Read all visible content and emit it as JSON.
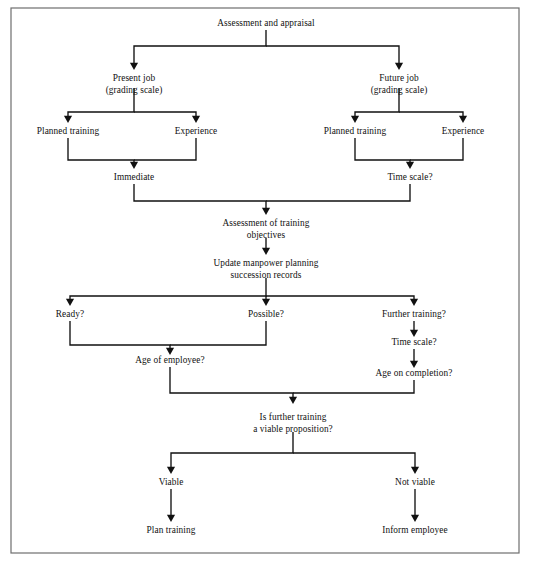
{
  "figure": {
    "title": "Assessment and appraisal",
    "frame": {
      "x": 11,
      "y": 8,
      "width": 508,
      "height": 545,
      "border_color": "#6e6e6e"
    },
    "canvas": {
      "width": 535,
      "height": 567,
      "background": "#ffffff"
    },
    "ink_color": "#111111",
    "caption_partial": ""
  },
  "nodes": [
    {
      "id": "assessment-and-appraisal",
      "lines": [
        "Assessment and appraisal"
      ],
      "x": 266,
      "y": 26
    },
    {
      "id": "present-job",
      "lines": [
        "Present job",
        "(grading scale)"
      ],
      "x": 134,
      "y": 81
    },
    {
      "id": "future-job",
      "lines": [
        "Future job",
        "(grading scale)"
      ],
      "x": 399,
      "y": 81
    },
    {
      "id": "planned-training-present",
      "lines": [
        "Planned training"
      ],
      "x": 68,
      "y": 134
    },
    {
      "id": "experience-present",
      "lines": [
        "Experience"
      ],
      "x": 196,
      "y": 134
    },
    {
      "id": "planned-training-future",
      "lines": [
        "Planned training"
      ],
      "x": 355,
      "y": 134
    },
    {
      "id": "experience-future",
      "lines": [
        "Experience"
      ],
      "x": 463,
      "y": 134
    },
    {
      "id": "immediate",
      "lines": [
        "Immediate"
      ],
      "x": 134,
      "y": 180
    },
    {
      "id": "time-scale-upper",
      "lines": [
        "Time scale?"
      ],
      "x": 410,
      "y": 180
    },
    {
      "id": "assessment-of-training-objectives",
      "lines": [
        "Assessment of training",
        "objectives"
      ],
      "x": 266,
      "y": 226
    },
    {
      "id": "update-manpower-planning",
      "lines": [
        "Update manpower planning",
        "succession records"
      ],
      "x": 266,
      "y": 266
    },
    {
      "id": "ready",
      "lines": [
        "Ready?"
      ],
      "x": 70,
      "y": 317
    },
    {
      "id": "possible",
      "lines": [
        "Possible?"
      ],
      "x": 266,
      "y": 317
    },
    {
      "id": "further-training",
      "lines": [
        "Further training?"
      ],
      "x": 414,
      "y": 317
    },
    {
      "id": "time-scale-lower",
      "lines": [
        "Time scale?"
      ],
      "x": 414,
      "y": 345
    },
    {
      "id": "age-of-employee",
      "lines": [
        "Age of employee?"
      ],
      "x": 170,
      "y": 363
    },
    {
      "id": "age-on-completion",
      "lines": [
        "Age on completion?"
      ],
      "x": 414,
      "y": 376
    },
    {
      "id": "is-further-training-viable",
      "lines": [
        "Is further training",
        "a viable proposition?"
      ],
      "x": 293,
      "y": 420
    },
    {
      "id": "viable",
      "lines": [
        "Viable"
      ],
      "x": 171,
      "y": 485
    },
    {
      "id": "not-viable",
      "lines": [
        "Not viable"
      ],
      "x": 415,
      "y": 485
    },
    {
      "id": "plan-training",
      "lines": [
        "Plan training"
      ],
      "x": 171,
      "y": 533
    },
    {
      "id": "inform-employee",
      "lines": [
        "Inform employee"
      ],
      "x": 415,
      "y": 533
    }
  ],
  "edges": [
    {
      "id": "edge-assessment-to-present-job",
      "name": "assessment-and-appraisal-to-present-job",
      "path": "M 266 30 L 266 46 L 134 46 L 134 64",
      "arrow": {
        "x": 134,
        "y": 70
      }
    },
    {
      "id": "edge-assessment-to-future-job",
      "name": "assessment-and-appraisal-to-future-job",
      "path": "M 266 46 L 399 46 L 399 64",
      "arrow": {
        "x": 399,
        "y": 70
      }
    },
    {
      "id": "edge-present-to-planned-training",
      "name": "present-job-to-planned-training",
      "path": "M 134 88 L 134 112 L 68 112 L 68 117",
      "arrow": {
        "x": 68,
        "y": 123
      }
    },
    {
      "id": "edge-present-to-experience",
      "name": "present-job-to-experience",
      "path": "M 134 112 L 196 112 L 196 117",
      "arrow": {
        "x": 196,
        "y": 123
      }
    },
    {
      "id": "edge-future-to-planned-training",
      "name": "future-job-to-planned-training",
      "path": "M 399 88 L 399 112 L 355 112 L 355 117",
      "arrow": {
        "x": 355,
        "y": 123
      }
    },
    {
      "id": "edge-future-to-experience",
      "name": "future-job-to-experience",
      "path": "M 399 112 L 463 112 L 463 117",
      "arrow": {
        "x": 463,
        "y": 123
      }
    },
    {
      "id": "edge-planned-training-to-immediate",
      "name": "planned-training-present-to-immediate",
      "path": "M 68 138 L 68 160 L 134 160 L 134 163",
      "arrow": {
        "x": 134,
        "y": 169
      }
    },
    {
      "id": "edge-experience-to-immediate",
      "name": "experience-present-to-immediate",
      "path": "M 196 138 L 196 160 L 134 160",
      "arrow": null
    },
    {
      "id": "edge-planned-training-to-time-scale",
      "name": "planned-training-future-to-time-scale",
      "path": "M 355 138 L 355 160 L 410 160 L 410 163",
      "arrow": {
        "x": 410,
        "y": 169
      }
    },
    {
      "id": "edge-experience-to-time-scale",
      "name": "experience-future-to-time-scale",
      "path": "M 463 138 L 463 160 L 410 160",
      "arrow": null
    },
    {
      "id": "edge-immediate-to-objectives",
      "name": "immediate-to-assessment-of-training-objectives",
      "path": "M 134 184 L 134 201 L 266 201 L 266 209",
      "arrow": {
        "x": 266,
        "y": 215
      }
    },
    {
      "id": "edge-time-scale-to-objectives",
      "name": "time-scale-upper-to-assessment-of-training-objectives",
      "path": "M 410 184 L 410 201 L 266 201",
      "arrow": null
    },
    {
      "id": "edge-objectives-to-update",
      "name": "assessment-of-training-objectives-to-update-manpower-planning",
      "path": "M 266 238 L 266 249",
      "arrow": {
        "x": 266,
        "y": 255
      }
    },
    {
      "id": "edge-update-to-ready",
      "name": "update-manpower-planning-to-ready",
      "path": "M 266 278 L 266 296 L 70 296 L 70 300",
      "arrow": {
        "x": 70,
        "y": 306
      }
    },
    {
      "id": "edge-update-to-possible",
      "name": "update-manpower-planning-to-possible",
      "path": "M 266 296 L 266 300",
      "arrow": {
        "x": 266,
        "y": 306
      }
    },
    {
      "id": "edge-update-to-further-training",
      "name": "update-manpower-planning-to-further-training",
      "path": "M 266 296 L 414 296 L 414 300",
      "arrow": {
        "x": 414,
        "y": 306
      }
    },
    {
      "id": "edge-ready-to-age-of-employee",
      "name": "ready-to-age-of-employee",
      "path": "M 70 321 L 70 345 L 170 345 L 170 349",
      "arrow": {
        "x": 170,
        "y": 355
      }
    },
    {
      "id": "edge-possible-to-age-of-employee",
      "name": "possible-to-age-of-employee",
      "path": "M 266 321 L 266 345 L 170 345",
      "arrow": null
    },
    {
      "id": "edge-further-training-to-time-scale",
      "name": "further-training-to-time-scale-lower",
      "path": "M 414 321 L 414 331",
      "arrow": {
        "x": 414,
        "y": 337
      }
    },
    {
      "id": "edge-time-scale-to-age-on-completion",
      "name": "time-scale-lower-to-age-on-completion",
      "path": "M 414 349 L 414 362",
      "arrow": {
        "x": 414,
        "y": 368
      }
    },
    {
      "id": "edge-age-of-employee-to-viability",
      "name": "age-of-employee-to-is-further-training-viable",
      "path": "M 170 367 L 170 393 L 293 393 L 293 398",
      "arrow": {
        "x": 293,
        "y": 404
      }
    },
    {
      "id": "edge-age-on-completion-to-viability",
      "name": "age-on-completion-to-is-further-training-viable",
      "path": "M 414 380 L 414 393 L 293 393",
      "arrow": null
    },
    {
      "id": "edge-viability-to-viable",
      "name": "is-further-training-viable-to-viable",
      "path": "M 293 432 L 293 453 L 171 453 L 171 468",
      "arrow": {
        "x": 171,
        "y": 474
      }
    },
    {
      "id": "edge-viability-to-not-viable",
      "name": "is-further-training-viable-to-not-viable",
      "path": "M 293 453 L 415 453 L 415 468",
      "arrow": {
        "x": 415,
        "y": 474
      }
    },
    {
      "id": "edge-viable-to-plan-training",
      "name": "viable-to-plan-training",
      "path": "M 171 489 L 171 516",
      "arrow": {
        "x": 171,
        "y": 522
      }
    },
    {
      "id": "edge-not-viable-to-inform-employee",
      "name": "not-viable-to-inform-employee",
      "path": "M 415 489 L 415 516",
      "arrow": {
        "x": 415,
        "y": 522
      }
    }
  ]
}
